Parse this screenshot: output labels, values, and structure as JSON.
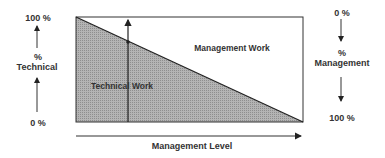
{
  "diagram": {
    "left_axis": {
      "top": "100 %",
      "middle_line1": "%",
      "middle_line2": "Technical",
      "bottom": "0 %"
    },
    "right_axis": {
      "top": "0 %",
      "middle_line1": "%",
      "middle_line2": "Management",
      "bottom": "100 %"
    },
    "regions": {
      "upper": "Management  Work",
      "lower": "Technical  Work"
    },
    "x_axis_label": "Management Level",
    "colors": {
      "shade": "#a8a8a8",
      "line": "#222222"
    }
  }
}
